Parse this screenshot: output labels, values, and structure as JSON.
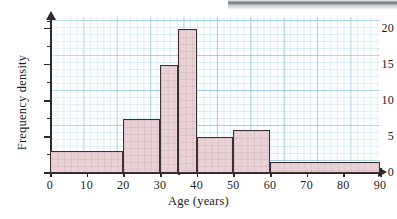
{
  "chart_data": {
    "type": "bar",
    "title": "",
    "subtitle": "",
    "xlabel": "Age (years)",
    "ylabel": "Frequency density",
    "xlim": [
      0,
      90
    ],
    "ylim": [
      0,
      21.5
    ],
    "grid": true,
    "grid_style": "graph-paper",
    "legend": "none",
    "bar_fill_color": "#e8d2d6",
    "bar_edge_color": "#3a3234",
    "grid_major_color": "#78b9d7",
    "grid_minor_color": "#96cde4",
    "axis_color": "#2e2a2b",
    "bins": [
      {
        "label": "0-20",
        "start": 0,
        "end": 20,
        "value": 3
      },
      {
        "label": "20-30",
        "start": 20,
        "end": 30,
        "value": 7.5
      },
      {
        "label": "30-35",
        "start": 30,
        "end": 35,
        "value": 15
      },
      {
        "label": "35-40",
        "start": 35,
        "end": 40,
        "value": 20
      },
      {
        "label": "40-50",
        "start": 40,
        "end": 50,
        "value": 5
      },
      {
        "label": "50-60",
        "start": 50,
        "end": 60,
        "value": 6
      },
      {
        "label": "60-90",
        "start": 60,
        "end": 90,
        "value": 1.5
      }
    ],
    "categories": [
      "0-20",
      "20-30",
      "30-35",
      "35-40",
      "40-50",
      "50-60",
      "60-90"
    ],
    "values": [
      3,
      7.5,
      15,
      20,
      5,
      6,
      1.5
    ],
    "x_ticks": [
      {
        "value": 0,
        "label": "0"
      },
      {
        "value": 10,
        "label": "10"
      },
      {
        "value": 20,
        "label": "20"
      },
      {
        "value": 30,
        "label": "30"
      },
      {
        "value": 40,
        "label": "40"
      },
      {
        "value": 50,
        "label": "50"
      },
      {
        "value": 60,
        "label": "60"
      },
      {
        "value": 70,
        "label": "70"
      },
      {
        "value": 80,
        "label": "80"
      },
      {
        "value": 90,
        "label": "90"
      }
    ],
    "x_minor_ticks": [
      35
    ],
    "y_ticks": [
      {
        "value": 0,
        "label": "0"
      },
      {
        "value": 5,
        "label": "5"
      },
      {
        "value": 10,
        "label": "10"
      },
      {
        "value": 15,
        "label": "15"
      },
      {
        "value": 20,
        "label": "20"
      }
    ],
    "y_minor_ticks": [
      2.5,
      7.5,
      12.5,
      17.5,
      21
    ],
    "annotations": []
  },
  "page": {
    "background_color": "#ffffff",
    "scan_artifact": "gray-scan-band-top-right"
  }
}
